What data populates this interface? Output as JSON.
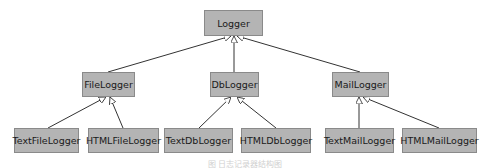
{
  "diagram": {
    "type": "class-hierarchy",
    "root": {
      "label": "Logger"
    },
    "level1": [
      {
        "label": "FileLogger"
      },
      {
        "label": "DbLogger"
      },
      {
        "label": "MailLogger"
      }
    ],
    "level2": [
      {
        "label": "TextFileLogger",
        "parent": "FileLogger"
      },
      {
        "label": "HTMLFileLogger",
        "parent": "FileLogger"
      },
      {
        "label": "TextDbLogger",
        "parent": "DbLogger"
      },
      {
        "label": "HTMLDbLogger",
        "parent": "DbLogger"
      },
      {
        "label": "TextMailLogger",
        "parent": "MailLogger"
      },
      {
        "label": "HTMLMailLogger",
        "parent": "MailLogger"
      }
    ],
    "edges": [
      {
        "from": "FileLogger",
        "to": "Logger",
        "arrow": "hollow-triangle"
      },
      {
        "from": "DbLogger",
        "to": "Logger",
        "arrow": "hollow-triangle"
      },
      {
        "from": "MailLogger",
        "to": "Logger",
        "arrow": "hollow-triangle"
      },
      {
        "from": "TextFileLogger",
        "to": "FileLogger",
        "arrow": "hollow-triangle"
      },
      {
        "from": "HTMLFileLogger",
        "to": "FileLogger",
        "arrow": "hollow-triangle"
      },
      {
        "from": "TextDbLogger",
        "to": "DbLogger",
        "arrow": "hollow-triangle"
      },
      {
        "from": "HTMLDbLogger",
        "to": "DbLogger",
        "arrow": "hollow-triangle"
      },
      {
        "from": "TextMailLogger",
        "to": "MailLogger",
        "arrow": "hollow-triangle"
      },
      {
        "from": "HTMLMailLogger",
        "to": "MailLogger",
        "arrow": "hollow-triangle"
      }
    ],
    "caption": "图 日志记录器结构图",
    "colors": {
      "box_fill": "#b4b4b4",
      "box_border": "#8a8a8a",
      "line": "#333333",
      "background": "#ffffff"
    }
  }
}
